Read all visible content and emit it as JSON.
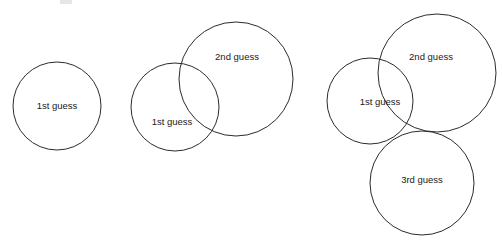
{
  "diagram": {
    "type": "venn-overlap-circles",
    "background_color": "#ffffff",
    "stroke_color": "#2b2b2b",
    "text_color": "#1a1a1a",
    "canvas": {
      "width": 502,
      "height": 242
    },
    "groups": [
      {
        "id": "group-1",
        "name": "single-guess-group",
        "circles": [
          {
            "id": "g1-c1",
            "label": "1st guess",
            "cx": 57,
            "cy": 106,
            "r": 44,
            "label_x": 57,
            "label_y": 106
          }
        ]
      },
      {
        "id": "group-2",
        "name": "two-guess-group",
        "circles": [
          {
            "id": "g2-c1",
            "label": "1st guess",
            "cx": 175,
            "cy": 107,
            "r": 44,
            "label_x": 172,
            "label_y": 122
          },
          {
            "id": "g2-c2",
            "label": "2nd guess",
            "cx": 236,
            "cy": 79,
            "r": 57,
            "label_x": 237,
            "label_y": 57
          }
        ]
      },
      {
        "id": "group-3",
        "name": "three-guess-group",
        "circles": [
          {
            "id": "g3-c1",
            "label": "1st guess",
            "cx": 370,
            "cy": 101,
            "r": 43,
            "label_x": 380,
            "label_y": 102
          },
          {
            "id": "g3-c2",
            "label": "2nd guess",
            "cx": 437,
            "cy": 73,
            "r": 59,
            "label_x": 431,
            "label_y": 57
          },
          {
            "id": "g3-c3",
            "label": "3rd guess",
            "cx": 422,
            "cy": 183,
            "r": 52,
            "label_x": 422,
            "label_y": 180
          }
        ]
      }
    ],
    "artifact": {
      "name": "cropped-text-fragment",
      "x": 60,
      "y": 0,
      "width": 12,
      "height": 4
    }
  }
}
